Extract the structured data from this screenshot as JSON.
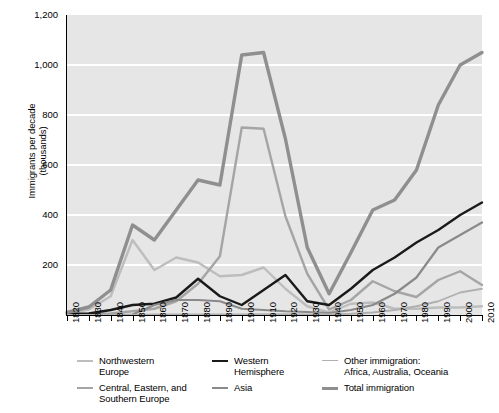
{
  "chart_data": {
    "type": "line",
    "title": "",
    "xlabel": "",
    "ylabel": "Immigrants per decade (thousands)",
    "ylabel_line1": "Immigrants per decade",
    "ylabel_line2": "(thousands)",
    "grid": true,
    "legend_position": "bottom",
    "xlim": [
      1820,
      2010
    ],
    "ylim": [
      0,
      1200
    ],
    "ytick_labels": [
      "1,200",
      "1,000",
      "800",
      "600",
      "400",
      "200"
    ],
    "ytick_values": [
      1200,
      1000,
      800,
      600,
      400,
      200
    ],
    "categories": [
      1820,
      1830,
      1840,
      1850,
      1860,
      1870,
      1880,
      1890,
      1900,
      1910,
      1920,
      1930,
      1940,
      1950,
      1960,
      1970,
      1980,
      1990,
      2000,
      2010
    ],
    "xtick_labels": [
      "1820",
      "1830",
      "1840",
      "1850",
      "1860",
      "1870",
      "1880",
      "1890",
      "1900",
      "1910",
      "1920",
      "1930",
      "1940",
      "1950",
      "1960",
      "1970",
      "1980",
      "1990",
      "2000",
      "2010"
    ],
    "series": [
      {
        "name": "Northwestern Europe",
        "name_line1": "Northwestern",
        "name_line2": "Europe",
        "color": "#b5b5b5",
        "width": 2.2,
        "values": [
          8,
          90,
          400,
          1200,
          1100,
          1500,
          2200,
          1500,
          900,
          900,
          550,
          230,
          80,
          300,
          280,
          120,
          110,
          150,
          130,
          110
        ]
      },
      {
        "name": "Central, Eastern, and Southern Europe",
        "name_line1": "Central, Eastern, and",
        "name_line2": "Southern Europe",
        "color": "#9a9a9a",
        "width": 2.2,
        "values": [
          3,
          5,
          10,
          25,
          40,
          90,
          230,
          420,
          750,
          750,
          400,
          180,
          30,
          60,
          180,
          180,
          120,
          180,
          200,
          150
        ]
      },
      {
        "name": "Western Hemisphere",
        "name_line1": "Western",
        "name_line2": "Hemisphere",
        "color": "#1a1a1a",
        "width": 2.2,
        "values": [
          12,
          12,
          33,
          62,
          75,
          167,
          404,
          427,
          39,
          362,
          1144,
          160,
          355,
          997,
          1716,
          1983,
          3616,
          4402,
          3901,
          4442
        ]
      },
      {
        "name": "Asia",
        "name_line1": "Asia",
        "name_line2": "",
        "color": "#787878",
        "width": 2.2,
        "values": [
          0,
          0,
          0,
          0,
          0,
          0,
          0,
          0,
          0,
          0,
          0,
          0,
          0,
          0,
          0,
          0,
          0,
          0,
          0,
          0
        ]
      },
      {
        "name": "Other immigration: Africa, Australia, Oceania",
        "name_line1": "Other immigration:",
        "name_line2": "Africa, Australia, Oceania",
        "color": "#a8a8a8",
        "width": 1.6,
        "values": [
          0,
          0,
          0,
          0,
          0,
          0,
          0,
          0,
          0,
          0,
          0,
          0,
          0,
          0,
          0,
          0,
          0,
          0,
          0,
          0
        ]
      },
      {
        "name": "Total immigration",
        "name_line1": "Total immigration",
        "name_line2": "",
        "color": "#8c8c8c",
        "width": 3.2,
        "values": [
          0,
          0,
          0,
          0,
          0,
          0,
          0,
          0,
          0,
          0,
          0,
          0,
          0,
          0,
          0,
          0,
          0,
          0,
          0,
          0
        ]
      }
    ],
    "plotted_series": [
      {
        "key": "northwestern_europe",
        "name": "Northwestern Europe",
        "color": "#bdbdbd",
        "width": 2.4,
        "points": [
          5,
          22,
          75,
          300,
          180,
          230,
          210,
          155,
          160,
          190,
          105,
          35,
          10,
          45,
          50,
          25,
          25,
          30,
          30,
          35
        ]
      },
      {
        "key": "central_eastern_southern_europe",
        "name": "Central, Eastern, and Southern Europe",
        "color": "#a5a5a5",
        "width": 2.4,
        "points": [
          2,
          3,
          6,
          15,
          25,
          55,
          125,
          235,
          750,
          745,
          395,
          165,
          22,
          60,
          135,
          95,
          72,
          140,
          175,
          120
        ]
      },
      {
        "key": "western_hemisphere",
        "name": "Western Hemisphere",
        "color": "#1a1a1a",
        "width": 2.4,
        "points": [
          4,
          6,
          20,
          40,
          45,
          70,
          145,
          75,
          40,
          100,
          160,
          55,
          40,
          105,
          180,
          230,
          290,
          340,
          400,
          450
        ]
      },
      {
        "key": "asia",
        "name": "Asia",
        "color": "#8a8a8a",
        "width": 2.2,
        "points": [
          0,
          0,
          0,
          2,
          40,
          60,
          60,
          55,
          25,
          20,
          15,
          12,
          8,
          20,
          40,
          85,
          150,
          270,
          320,
          370
        ]
      },
      {
        "key": "other_immigration",
        "name": "Other immigration: Africa, Australia, Oceania",
        "color": "#b0b0b0",
        "width": 1.8,
        "points": [
          0,
          0,
          0,
          0,
          2,
          2,
          2,
          2,
          2,
          3,
          3,
          2,
          2,
          5,
          10,
          20,
          35,
          55,
          90,
          105
        ]
      },
      {
        "key": "total_immigration",
        "name": "Total immigration",
        "color": "#8f8f8f",
        "width": 3.4,
        "points": [
          10,
          32,
          100,
          360,
          300,
          420,
          540,
          520,
          1040,
          1050,
          705,
          270,
          85,
          250,
          420,
          460,
          580,
          840,
          1000,
          1050
        ]
      }
    ]
  },
  "legend": {
    "columns": [
      {
        "items": [
          {
            "label_line1": "Northwestern",
            "label_line2": "Europe",
            "color": "#bdbdbd",
            "thickness": "2.4px",
            "name": "legend-northwestern-europe"
          },
          {
            "label_line1": "Central, Eastern, and",
            "label_line2": "Southern Europe",
            "color": "#a5a5a5",
            "thickness": "2.4px",
            "name": "legend-central-eastern-southern-europe"
          }
        ]
      },
      {
        "items": [
          {
            "label_line1": "Western",
            "label_line2": "Hemisphere",
            "color": "#1a1a1a",
            "thickness": "2.8px",
            "name": "legend-western-hemisphere"
          },
          {
            "label_line1": "Asia",
            "label_line2": "",
            "color": "#8a8a8a",
            "thickness": "2.4px",
            "name": "legend-asia"
          }
        ]
      },
      {
        "items": [
          {
            "label_line1": "Other immigration:",
            "label_line2": "Africa, Australia, Oceania",
            "color": "#b0b0b0",
            "thickness": "1.8px",
            "name": "legend-other-immigration"
          },
          {
            "label_line1": "Total immigration",
            "label_line2": "",
            "color": "#8f8f8f",
            "thickness": "3.4px",
            "name": "legend-total-immigration"
          }
        ]
      }
    ]
  },
  "colors": {
    "plot_background": "#e6e6e6",
    "gridline": "#ffffff",
    "axis": "#000000"
  }
}
